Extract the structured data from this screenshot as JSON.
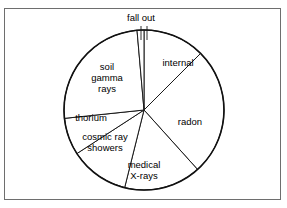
{
  "figure": {
    "title": "",
    "border_color": "#6e6e6e",
    "background": "#ffffff",
    "stroke_color": "#1a1a1a"
  },
  "chart_data": {
    "type": "pie",
    "title": "",
    "xlabel": "",
    "ylabel": "",
    "legend_position": "none",
    "grid": false,
    "center": {
      "cx": 144,
      "cy": 110
    },
    "radius": 80,
    "categories": [
      "internal",
      "radon",
      "medical X-rays",
      "cosmic ray showers",
      "thorium",
      "soil gamma rays",
      "fall out"
    ],
    "values": [
      12.5,
      26.0,
      11.5,
      10.0,
      4.0,
      34.0,
      2.0
    ],
    "slices": [
      {
        "label": "internal",
        "label_lines": [
          "internal"
        ],
        "value": 12.5,
        "start_deg": 0,
        "end_deg": 45,
        "label_x": 178,
        "label_y": 66
      },
      {
        "label": "radon",
        "label_lines": [
          "radon"
        ],
        "value": 26.0,
        "start_deg": 45,
        "end_deg": 138,
        "label_x": 190,
        "label_y": 125
      },
      {
        "label": "medical X-rays",
        "label_lines": [
          "medical",
          "X-rays"
        ],
        "value": 11.5,
        "start_deg": 138,
        "end_deg": 194,
        "label_x": 144,
        "label_y": 168
      },
      {
        "label": "cosmic ray showers",
        "label_lines": [
          "cosmic ray",
          "showers"
        ],
        "value": 10.0,
        "start_deg": 194,
        "end_deg": 237,
        "label_x": 105,
        "label_y": 140
      },
      {
        "label": "thorium",
        "label_lines": [
          "thorium"
        ],
        "value": 4.0,
        "start_deg": 237,
        "end_deg": 264,
        "label_x": 91,
        "label_y": 121
      },
      {
        "label": "soil gamma rays",
        "label_lines": [
          "soil",
          "gamma",
          "rays"
        ],
        "value": 34.0,
        "start_deg": 264,
        "end_deg": 355,
        "label_x": 107,
        "label_y": 70
      },
      {
        "label": "fall out",
        "label_lines": [
          "fall out"
        ],
        "value": 2.0,
        "start_deg": 355,
        "end_deg": 360,
        "label_x": 141,
        "label_y": 21
      }
    ]
  }
}
